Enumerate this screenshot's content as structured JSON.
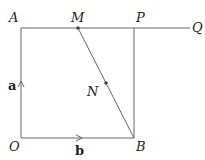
{
  "points": {
    "A": "A",
    "M": "M",
    "P": "P",
    "Q": "Q",
    "N": "N",
    "O": "O",
    "B": "B"
  },
  "vectors": {
    "a": "a",
    "b": "b"
  },
  "colors": {
    "line": "#555555",
    "text": "#222222"
  }
}
